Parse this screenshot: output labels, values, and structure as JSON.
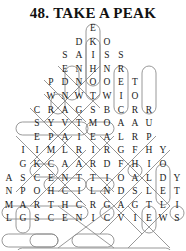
{
  "puzzle": {
    "number": "48.",
    "title": "48. TAKE A PEAK",
    "type": "word-search",
    "shape": "mountain-peak",
    "rows": [
      {
        "index": 1,
        "letters": [
          "E"
        ]
      },
      {
        "index": 2,
        "letters": [
          "D",
          "K",
          "O"
        ]
      },
      {
        "index": 3,
        "letters": [
          "S",
          "A",
          "I",
          "S",
          "S"
        ]
      },
      {
        "index": 4,
        "letters": [
          "E",
          "N",
          "H",
          "N",
          "R"
        ]
      },
      {
        "index": 5,
        "letters": [
          "P",
          "D",
          "N",
          "O",
          "O",
          "E",
          "T"
        ]
      },
      {
        "index": 6,
        "letters": [
          "W",
          "N",
          "W",
          "T",
          "W",
          "I",
          "O"
        ]
      },
      {
        "index": 7,
        "letters": [
          "C",
          "R",
          "A",
          "G",
          "S",
          "B",
          "C",
          "R",
          "R"
        ]
      },
      {
        "index": 8,
        "letters": [
          "S",
          "Y",
          "V",
          "T",
          "M",
          "O",
          "A",
          "A",
          "U"
        ]
      },
      {
        "index": 9,
        "letters": [
          "E",
          "P",
          "A",
          "I",
          "E",
          "A",
          "L",
          "R",
          "P"
        ]
      },
      {
        "index": 10,
        "letters": [
          "I",
          "I",
          "M",
          "L",
          "R",
          "I",
          "R",
          "G",
          "F",
          "H",
          "Y"
        ]
      },
      {
        "index": 11,
        "letters": [
          "G",
          "K",
          "C",
          "A",
          "A",
          "R",
          "D",
          "F",
          "H",
          "I",
          "O"
        ]
      },
      {
        "index": 12,
        "letters": [
          "A",
          "S",
          "C",
          "E",
          "N",
          "T",
          "T",
          "I",
          "O",
          "A",
          "L",
          "D",
          "Y"
        ]
      },
      {
        "index": 13,
        "letters": [
          "N",
          "P",
          "O",
          "H",
          "C",
          "I",
          "L",
          "N",
          "D",
          "S",
          "L",
          "E",
          "T"
        ]
      },
      {
        "index": 14,
        "letters": [
          "M",
          "A",
          "R",
          "T",
          "H",
          "C",
          "R",
          "G",
          "A",
          "G",
          "T",
          "L",
          "I"
        ]
      },
      {
        "index": 15,
        "letters": [
          "L",
          "G",
          "S",
          "C",
          "E",
          "N",
          "I",
          "C",
          "V",
          "I",
          "E",
          "W",
          "S"
        ]
      }
    ],
    "found_words": [
      "ASCENT",
      "CRAGS",
      "MART",
      "SCENIC VIEWS",
      "SKI",
      "SNOW",
      "SUMMIT",
      "PEAK"
    ],
    "ink_color": "#1a1a1a",
    "mark_color": "#8d8d8d"
  }
}
